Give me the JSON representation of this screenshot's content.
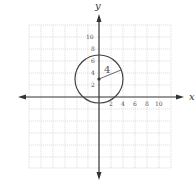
{
  "diagram": {
    "type": "coordinate-plane-circle",
    "axes": {
      "x_label": "x",
      "y_label": "y"
    },
    "x_ticks": [
      "2",
      "4",
      "6",
      "8",
      "10"
    ],
    "y_ticks": [
      "2",
      "4",
      "6",
      "8",
      "10"
    ],
    "circle": {
      "center": [
        0,
        3
      ],
      "radius": 4,
      "radius_label": "4"
    },
    "grid": {
      "spacing_units": 2,
      "range": [
        -12,
        12
      ]
    },
    "colors": {
      "grid": "#c8c8c8",
      "axis": "#333333",
      "circle": "#444444"
    }
  }
}
